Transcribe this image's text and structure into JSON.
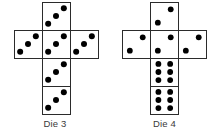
{
  "figure": {
    "background_color": "#ffffff",
    "stroke_color": "#2b2b2b",
    "pip_color": "#000000",
    "caption_color": "#3a3a3a"
  },
  "dice": [
    {
      "id": "die-3",
      "caption": "Die 3",
      "net_shape": "cross",
      "cell_size": 28,
      "origin_x": 14,
      "origin_y": 2,
      "faces": [
        {
          "name": "top",
          "col": 1,
          "row": 0,
          "pips": 3,
          "pattern": "diagonal"
        },
        {
          "name": "left",
          "col": 0,
          "row": 1,
          "pips": 3,
          "pattern": "diagonal"
        },
        {
          "name": "center",
          "col": 1,
          "row": 1,
          "pips": 3,
          "pattern": "diagonal"
        },
        {
          "name": "right",
          "col": 2,
          "row": 1,
          "pips": 3,
          "pattern": "diagonal"
        },
        {
          "name": "below-center",
          "col": 1,
          "row": 2,
          "pips": 3,
          "pattern": "diagonal"
        },
        {
          "name": "bottom",
          "col": 1,
          "row": 3,
          "pips": 3,
          "pattern": "diagonal"
        }
      ]
    },
    {
      "id": "die-4",
      "caption": "Die 4",
      "net_shape": "cross",
      "cell_size": 28,
      "origin_x": 12,
      "origin_y": 2,
      "faces": [
        {
          "name": "top",
          "col": 1,
          "row": 0,
          "pips": 2,
          "pattern": "diagonal"
        },
        {
          "name": "left",
          "col": 0,
          "row": 1,
          "pips": 2,
          "pattern": "diagonal"
        },
        {
          "name": "center",
          "col": 1,
          "row": 1,
          "pips": 2,
          "pattern": "diagonal"
        },
        {
          "name": "right",
          "col": 2,
          "row": 1,
          "pips": 2,
          "pattern": "diagonal"
        },
        {
          "name": "below-center",
          "col": 1,
          "row": 2,
          "pips": 6,
          "pattern": "grid-2x3"
        },
        {
          "name": "bottom",
          "col": 1,
          "row": 3,
          "pips": 6,
          "pattern": "grid-2x3"
        }
      ]
    }
  ]
}
